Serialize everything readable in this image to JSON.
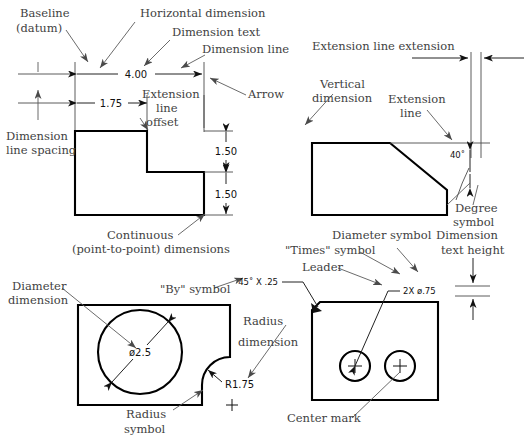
{
  "figure": {
    "ink_color": "#000000",
    "label_color": "#3f3f3f",
    "thin_line_color": "#4a4a4a",
    "background": "#ffffff"
  },
  "labels": {
    "baseline": "Baseline",
    "datum": "(datum)",
    "horizontal_dimension": "Horizontal dimension",
    "dimension_text": "Dimension text",
    "dimension_line": "Dimension line",
    "arrow": "Arrow",
    "extension_line_offset_1": "Extension",
    "extension_line_offset_2": "line",
    "extension_line_offset_3": "offset",
    "dimension_line_spacing_1": "Dimension",
    "dimension_line_spacing_2": "line spacing",
    "continuous_1": "Continuous",
    "continuous_2": "(point-to-point) dimensions",
    "vertical_dimension_1": "Vertical",
    "vertical_dimension_2": "dimension",
    "extension_line_extension": "Extension line extension",
    "extension_line_1": "Extension",
    "extension_line_2": "line",
    "degree_symbol_1": "Degree",
    "degree_symbol_2": "symbol",
    "diameter_dimension_1": "Diameter",
    "diameter_dimension_2": "dimension",
    "by_symbol": "\"By\" symbol",
    "radius_dimension_1": "Radius",
    "radius_dimension_2": "dimension",
    "radius_symbol_1": "Radius",
    "radius_symbol_2": "symbol",
    "diameter_symbol": "Diameter symbol",
    "times_symbol": "\"Times\" symbol",
    "leader": "Leader",
    "dimension_text_height_1": "Dimension",
    "dimension_text_height_2": "text height",
    "center_mark": "Center mark"
  },
  "dimensions": {
    "top_horizontal": "4.00",
    "top_horizontal_inner": "1.75",
    "right_vertical_upper": "1.50",
    "right_vertical_lower": "1.50",
    "angle": "40˚",
    "chamfer": "45˚  X  .25",
    "hole_diameter": "ø2.5",
    "fillet_radius": "R1.75",
    "hole_callout": "2X  ø.75"
  },
  "views": [
    {
      "name": "upper-left-l-block",
      "shape": "L-shaped block with notch at upper right",
      "dimensions": [
        "4.00",
        "1.75",
        "1.50",
        "1.50"
      ]
    },
    {
      "name": "upper-right-chamfered-block",
      "shape": "Rectangular block with 40 degree chamfer at upper right",
      "dimensions": [
        "40˚"
      ]
    },
    {
      "name": "lower-left-plate-with-hole",
      "shape": "Plate with large circular hole and filleted lower-right corner",
      "dimensions": [
        "ø2.5",
        "R1.75"
      ]
    },
    {
      "name": "lower-right-plate-with-two-holes",
      "shape": "Plate with chamfered upper-left corner and two small holes with center marks",
      "dimensions": [
        "45˚  X  .25",
        "2X  ø.75"
      ]
    }
  ]
}
